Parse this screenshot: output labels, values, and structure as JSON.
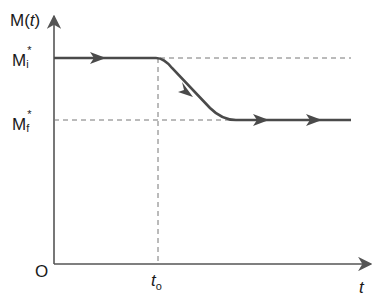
{
  "diagram": {
    "y_axis_label": {
      "prefix": "M(",
      "var": "t",
      "suffix": ")"
    },
    "x_axis_label": "t",
    "origin_label": "O",
    "levels": [
      {
        "name": "Mi",
        "base": "M",
        "sub": "i",
        "sup": "*"
      },
      {
        "name": "Mf",
        "base": "M",
        "sub": "f",
        "sup": "*"
      }
    ],
    "time_marker": {
      "base": "t",
      "sub": "o"
    },
    "colors": {
      "curve": "#4a4a4a",
      "axis": "#555555",
      "dash": "#777777",
      "text": "#1a1a1a"
    }
  }
}
